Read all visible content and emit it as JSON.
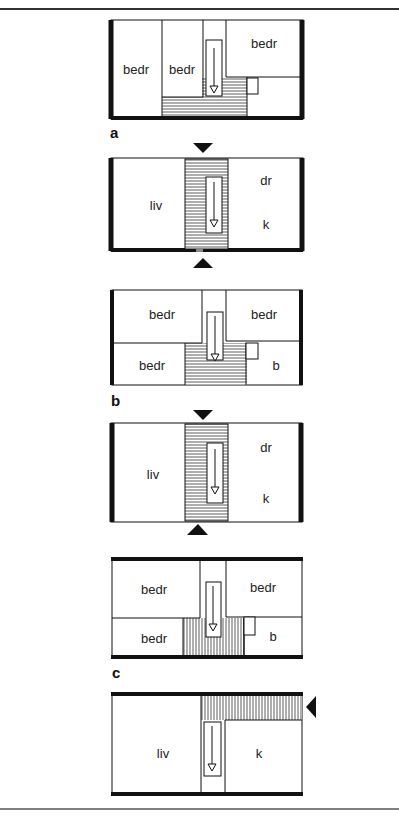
{
  "figure": {
    "panels": [
      {
        "id": "a",
        "caption": "a",
        "plans": [
          {
            "level": "upper",
            "rooms": [
              "bedr",
              "bedr",
              "bedr"
            ]
          }
        ]
      },
      {
        "id": "a-lower",
        "caption": "",
        "plans": [
          {
            "level": "lower",
            "rooms": [
              "liv",
              "dr",
              "k"
            ],
            "entrances": [
              "top",
              "bottom"
            ]
          }
        ]
      },
      {
        "id": "b",
        "caption": "b",
        "plans": [
          {
            "level": "upper",
            "rooms": [
              "bedr",
              "bedr",
              "bedr",
              "b"
            ]
          }
        ]
      },
      {
        "id": "b-lower",
        "caption": "",
        "plans": [
          {
            "level": "lower",
            "rooms": [
              "liv",
              "dr",
              "k"
            ],
            "entrances": [
              "top",
              "bottom"
            ]
          }
        ]
      },
      {
        "id": "c",
        "caption": "c",
        "plans": [
          {
            "level": "upper",
            "rooms": [
              "bedr",
              "bedr",
              "bedr",
              "b"
            ]
          }
        ]
      },
      {
        "id": "c-lower",
        "caption": "",
        "plans": [
          {
            "level": "lower",
            "rooms": [
              "liv",
              "k"
            ],
            "entrances": [
              "right"
            ]
          }
        ]
      }
    ]
  },
  "labels": {
    "a_bedr1": "bedr",
    "a_bedr2": "bedr",
    "a_bedr3": "bedr",
    "a_caption": "a",
    "a2_liv": "liv",
    "a2_dr": "dr",
    "a2_k": "k",
    "b_bedr1": "bedr",
    "b_bedr2": "bedr",
    "b_bedr3": "bedr",
    "b_b": "b",
    "b_caption": "b",
    "b2_liv": "liv",
    "b2_dr": "dr",
    "b2_k": "k",
    "c_bedr1": "bedr",
    "c_bedr2": "bedr",
    "c_bedr3": "bedr",
    "c_b": "b",
    "c_caption": "c",
    "c2_liv": "liv",
    "c2_k": "k"
  }
}
